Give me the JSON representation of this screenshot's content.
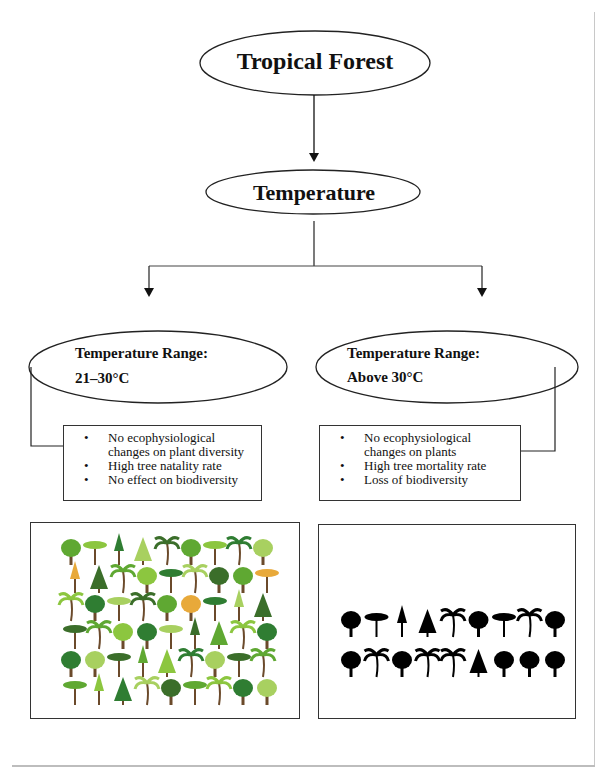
{
  "diagram": {
    "root": {
      "label": "Tropical Forest"
    },
    "factor": {
      "label": "Temperature"
    },
    "branches": [
      {
        "range_heading": "Temperature Range:",
        "range_value": "21–30°C",
        "effects": [
          "No ecophysiological changes on plant diversity",
          "High tree natality rate",
          "No effect on biodiversity"
        ],
        "illustration": {
          "icon": "colorful-tree-collection-icon",
          "description": "Green, colorful assortment of tropical trees (54 trees in 6 rows)"
        }
      },
      {
        "range_heading": "Temperature Range:",
        "range_value": "Above 30°C",
        "effects": [
          "No ecophysiological changes on plants",
          "High tree mortality rate",
          "Loss of biodiversity"
        ],
        "illustration": {
          "icon": "tree-silhouette-collection-icon",
          "description": "Black silhouettes of tropical trees (18 trees in 2 rows)"
        }
      }
    ]
  },
  "colors": {
    "line": "#111111",
    "border": "#333333",
    "tree_greens": [
      "#5fa832",
      "#8cc63f",
      "#2f7d32",
      "#a8d060",
      "#3b6e2a"
    ],
    "tree_autumn": [
      "#c9a165",
      "#e8a93a"
    ],
    "silhouette": "#000000"
  }
}
